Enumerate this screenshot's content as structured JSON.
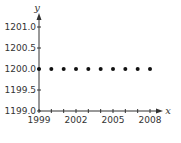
{
  "chart_data": {
    "type": "scatter",
    "title": "",
    "xlabel": "x",
    "ylabel": "y",
    "x": [
      1999,
      2000,
      2001,
      2002,
      2003,
      2004,
      2005,
      2006,
      2007,
      2008
    ],
    "series": [
      {
        "name": "",
        "values": [
          1200.0,
          1200.0,
          1200.0,
          1200.0,
          1200.0,
          1200.0,
          1200.0,
          1200.0,
          1200.0,
          1200.0
        ]
      }
    ],
    "xlim": [
      1999,
      2008
    ],
    "ylim": [
      1199.0,
      1201.0
    ],
    "x_ticks": [
      1999,
      2000,
      2001,
      2002,
      2003,
      2004,
      2005,
      2006,
      2007,
      2008
    ],
    "x_tick_labels": [
      "1999",
      "2002",
      "2005",
      "2008"
    ],
    "y_ticks": [
      1199.0,
      1199.5,
      1200.0,
      1200.5,
      1201.0
    ],
    "y_tick_labels": [
      "1199.0",
      "1199.5",
      "1200.0",
      "1200.5",
      "1201.0"
    ],
    "grid": false,
    "legend": null,
    "colors": {
      "axis": "#333333",
      "points": "#111111"
    }
  }
}
